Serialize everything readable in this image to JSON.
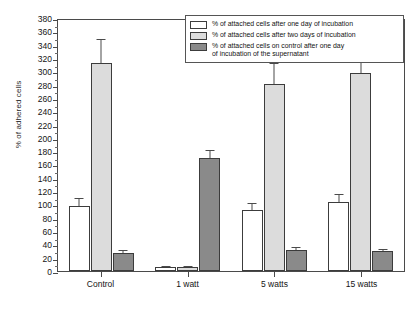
{
  "chart_data": {
    "type": "bar",
    "title": "",
    "xlabel": "",
    "ylabel": "% of adhered cells",
    "ylim": [
      0,
      380
    ],
    "ytick_step": 20,
    "yminor_step": 10,
    "grid": false,
    "legend_position": "top-right",
    "categories": [
      "Control",
      "1 watt",
      "5 watts",
      "15 watts"
    ],
    "yticks": [
      0,
      20,
      40,
      60,
      80,
      100,
      120,
      140,
      160,
      180,
      200,
      220,
      240,
      260,
      280,
      300,
      320,
      340,
      360,
      380
    ],
    "series": [
      {
        "name": "% of attached cells after one day of incubation",
        "color": "#ffffff",
        "values": [
          98,
          6,
          92,
          104
        ],
        "errors": [
          12,
          2,
          10,
          12
        ]
      },
      {
        "name": "% of attached cells after two days of incubation",
        "color": "#dcdcdc",
        "values": [
          313,
          6,
          281,
          298
        ],
        "errors": [
          35,
          2,
          32,
          36
        ]
      },
      {
        "name": "% of attached cells on control after one day of incubation of the supernatant",
        "color": "#8a8a8a",
        "values": [
          27,
          170,
          32,
          30
        ],
        "errors": [
          4,
          12,
          4,
          3
        ]
      }
    ]
  },
  "legend": {
    "items": [
      {
        "swatch": "white-swatch",
        "line1": "% of attached cells after one day of incubation",
        "line2": ""
      },
      {
        "swatch": "light-gray-swatch",
        "line1": "% of attached cells after two days of incubation",
        "line2": ""
      },
      {
        "swatch": "dark-gray-swatch",
        "line1": "% of attached cells on control after one day",
        "line2": "of incubation of the supernatant"
      }
    ]
  },
  "axis": {
    "y_title": "% of adhered cells"
  }
}
